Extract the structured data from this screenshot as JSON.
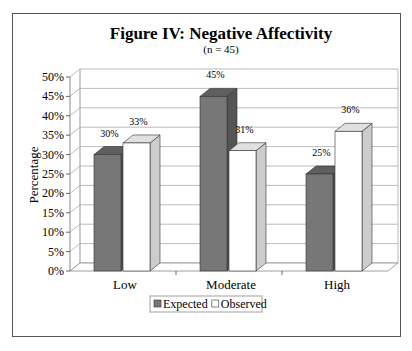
{
  "chart_data": {
    "type": "bar",
    "title": "Figure IV: Negative Affectivity",
    "subtitle": "(n = 45)",
    "xlabel": "",
    "ylabel": "Percentage",
    "ylim": [
      0,
      50
    ],
    "yticks": [
      "0%",
      "5%",
      "10%",
      "15%",
      "20%",
      "25%",
      "30%",
      "35%",
      "40%",
      "45%",
      "50%"
    ],
    "categories": [
      "Low",
      "Moderate",
      "High"
    ],
    "series": [
      {
        "name": "Expected",
        "values": [
          30,
          45,
          25
        ],
        "labels": [
          "30%",
          "45%",
          "25%"
        ],
        "color": "#777777",
        "top": "#5f5f5f",
        "side": "#555555"
      },
      {
        "name": "Observed",
        "values": [
          33,
          31,
          36
        ],
        "labels": [
          "33%",
          "31%",
          "36%"
        ],
        "color": "#ffffff",
        "top": "#e0e0e0",
        "side": "#cccccc"
      }
    ],
    "grid": true,
    "legend_position": "bottom",
    "style": "3d-clustered-column"
  }
}
